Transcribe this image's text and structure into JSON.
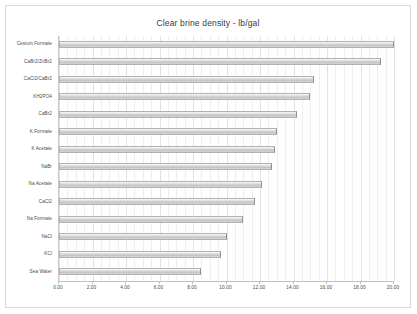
{
  "chart_data": {
    "type": "bar",
    "orientation": "horizontal",
    "title": "Clear brine density - lb/gal",
    "xlabel": "",
    "ylabel": "",
    "xlim": [
      0,
      20
    ],
    "xticks": [
      "0.00",
      "2.00",
      "4.00",
      "6.00",
      "8.00",
      "10.00",
      "12.00",
      "14.00",
      "16.00",
      "18.00",
      "20.00"
    ],
    "xtick_values": [
      0,
      2,
      4,
      6,
      8,
      10,
      12,
      14,
      16,
      18,
      20
    ],
    "grid": true,
    "legend": false,
    "categories": [
      "Cesium Formate",
      "CaBr2/ZnBr2",
      "CaCl2/CaBr2",
      "KH2PO4",
      "CaBr2",
      "K Formate",
      "K Acetate",
      "NaBr",
      "Na Acetate",
      "CaCl2",
      "Na Formate",
      "NaCl",
      "KCl",
      "Sea Water"
    ],
    "values": [
      20.0,
      19.2,
      15.2,
      15.0,
      14.2,
      13.0,
      12.9,
      12.7,
      12.1,
      11.7,
      11.0,
      10.0,
      9.7,
      8.5
    ],
    "bar_color": "#cfcfcf",
    "bar_border_color": "#b2b2b2",
    "grid_color": "#e2e2e2",
    "background_color": "#ffffff",
    "text_color": "#4a4a4a"
  }
}
